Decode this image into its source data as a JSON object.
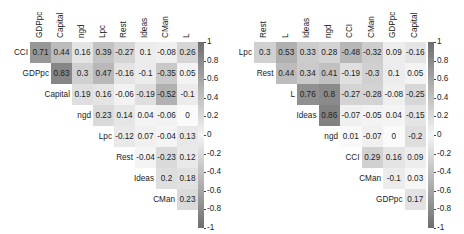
{
  "chart_data": [
    {
      "type": "heatmap",
      "title": "",
      "subtype": "upper-triangular correlation matrix",
      "columns": [
        "GDPpc",
        "Capital",
        "ngd",
        "Lpc",
        "Rest",
        "Ideas",
        "CMan",
        "L"
      ],
      "rows": [
        "CCI",
        "GDPpc",
        "Capital",
        "ngd",
        "Lpc",
        "Rest",
        "Ideas",
        "CMan"
      ],
      "values": [
        [
          0.71,
          0.44,
          0.16,
          0.39,
          -0.27,
          0.1,
          -0.08,
          0.26
        ],
        [
          null,
          0.83,
          0.3,
          0.47,
          -0.16,
          -0.1,
          -0.35,
          0.05
        ],
        [
          null,
          null,
          0.19,
          0.16,
          -0.06,
          -0.19,
          -0.52,
          -0.1
        ],
        [
          null,
          null,
          null,
          0.23,
          0.14,
          0.04,
          -0.06,
          0
        ],
        [
          null,
          null,
          null,
          null,
          -0.12,
          0.07,
          -0.04,
          0.13
        ],
        [
          null,
          null,
          null,
          null,
          null,
          -0.04,
          -0.23,
          0.12
        ],
        [
          null,
          null,
          null,
          null,
          null,
          null,
          0.2,
          0.18
        ],
        [
          null,
          null,
          null,
          null,
          null,
          null,
          null,
          0.23
        ]
      ],
      "colorbar": {
        "range": [
          -1,
          1
        ],
        "ticks": [
          "1",
          "0.8",
          "0.6",
          "0.4",
          "0.2",
          "0",
          "-0.2",
          "-0.4",
          "-0.6",
          "-0.8",
          "-1"
        ]
      },
      "colormap": "gray (|r| darker)"
    },
    {
      "type": "heatmap",
      "title": "",
      "subtype": "upper-triangular correlation matrix",
      "columns": [
        "Rest",
        "L",
        "Ideas",
        "ngd",
        "CCI",
        "CMan",
        "GDPpc",
        "Capital"
      ],
      "rows": [
        "Lpc",
        "Rest",
        "L",
        "Ideas",
        "ngd",
        "CCI",
        "CMan",
        "GDPpc"
      ],
      "values": [
        [
          0.3,
          0.53,
          0.33,
          0.28,
          -0.48,
          -0.32,
          0.09,
          -0.16
        ],
        [
          null,
          0.44,
          0.34,
          0.41,
          -0.19,
          -0.3,
          0.1,
          0.05
        ],
        [
          null,
          null,
          0.76,
          0.8,
          -0.27,
          -0.28,
          -0.08,
          -0.25
        ],
        [
          null,
          null,
          null,
          0.86,
          -0.07,
          -0.05,
          0.04,
          -0.15
        ],
        [
          null,
          null,
          null,
          null,
          0.01,
          -0.07,
          0,
          -0.2
        ],
        [
          null,
          null,
          null,
          null,
          null,
          0.29,
          0.16,
          0.09
        ],
        [
          null,
          null,
          null,
          null,
          null,
          null,
          -0.1,
          0.03
        ],
        [
          null,
          null,
          null,
          null,
          null,
          null,
          null,
          0.17
        ]
      ],
      "colorbar": {
        "range": [
          -1,
          1
        ],
        "ticks": [
          "1",
          "0.8",
          "0.6",
          "0.4",
          "0.2",
          "0",
          "-0.2",
          "-0.4",
          "-0.6",
          "-0.8",
          "-1"
        ]
      },
      "colormap": "gray (|r| darker)"
    }
  ]
}
